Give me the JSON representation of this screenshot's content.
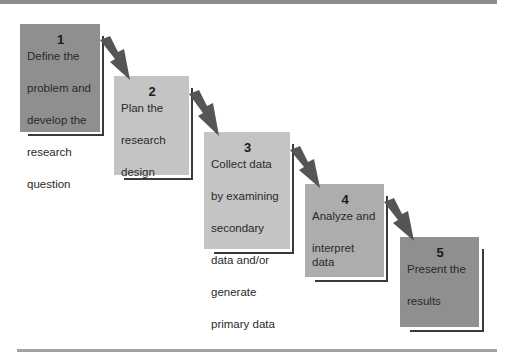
{
  "diagram": {
    "type": "step-process",
    "steps": [
      {
        "number": "1",
        "label": "Define the problem and develop the research question",
        "lines": [
          "Define the",
          "problem and",
          "develop the",
          "research",
          "question"
        ],
        "color": "#8f8f8f"
      },
      {
        "number": "2",
        "label": "Plan the research design",
        "lines": [
          "Plan the",
          "research",
          "design"
        ],
        "color": "#c4c4c4"
      },
      {
        "number": "3",
        "label": "Collect data by examining secondary data and/or generate primary data",
        "lines": [
          "Collect data",
          "by examining",
          "secondary",
          "data and/or",
          "generate",
          "primary data"
        ],
        "color": "#c4c4c4"
      },
      {
        "number": "4",
        "label": "Analyze and interpret data",
        "lines": [
          "Analyze and",
          "interpret data"
        ],
        "color": "#adadad"
      },
      {
        "number": "5",
        "label": "Present the results",
        "lines": [
          "Present the",
          "results"
        ],
        "color": "#8f8f8f"
      }
    ],
    "arrow_color": "#555555",
    "frame_color": "#8c8c8c"
  }
}
